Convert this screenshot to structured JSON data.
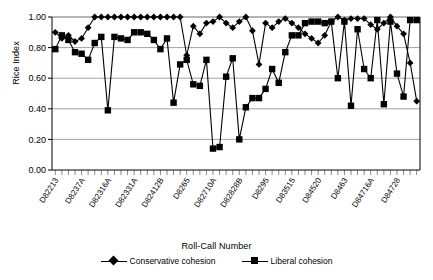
{
  "chart_data": {
    "type": "line",
    "title": "",
    "xlabel": "Roll-Call Number",
    "ylabel": "Rice Index",
    "ylim": [
      0.0,
      1.0
    ],
    "ytick_labels": [
      "0.00",
      "0.20",
      "0.40",
      "0.60",
      "0.80",
      "1.00"
    ],
    "ytick_values": [
      0.0,
      0.2,
      0.4,
      0.6,
      0.8,
      1.0
    ],
    "grid": "horizontal",
    "legend_position": "below",
    "xtick_labels": [
      "D82213",
      "D8237A",
      "D82316A",
      "D82331A",
      "D82412B",
      "D8265",
      "D82710A",
      "D82828B",
      "D8295",
      "D83515",
      "D84520",
      "D8463",
      "D84716A",
      "D84728"
    ],
    "xtick_indices": [
      0,
      4,
      8,
      12,
      16,
      20,
      24,
      28,
      32,
      36,
      40,
      44,
      48,
      52
    ],
    "n_points": 56,
    "series": [
      {
        "name": "Conservative cohesion",
        "marker": "diamond",
        "values": [
          0.9,
          0.86,
          0.88,
          0.84,
          0.86,
          0.93,
          1.0,
          1.0,
          1.0,
          1.0,
          1.0,
          1.0,
          1.0,
          1.0,
          1.0,
          1.0,
          1.0,
          1.0,
          1.0,
          1.0,
          0.75,
          0.94,
          0.89,
          0.96,
          0.97,
          1.0,
          0.96,
          0.93,
          0.97,
          1.0,
          0.91,
          0.69,
          0.96,
          0.93,
          0.97,
          0.99,
          0.96,
          0.93,
          0.89,
          0.86,
          0.83,
          0.88,
          0.97,
          1.0,
          0.98,
          0.99,
          0.99,
          0.99,
          0.95,
          0.92,
          0.96,
          1.0,
          0.94,
          0.89,
          0.7,
          0.45
        ]
      },
      {
        "name": "Liberal cohesion",
        "marker": "square",
        "values": [
          0.79,
          0.88,
          0.85,
          0.77,
          0.76,
          0.72,
          0.83,
          0.87,
          0.39,
          0.87,
          0.86,
          0.85,
          0.9,
          0.9,
          0.89,
          0.85,
          0.79,
          0.86,
          0.44,
          0.69,
          0.72,
          0.56,
          0.55,
          0.72,
          0.14,
          0.15,
          0.61,
          0.73,
          0.2,
          0.41,
          0.47,
          0.47,
          0.53,
          0.66,
          0.57,
          0.77,
          0.88,
          0.88,
          0.96,
          0.97,
          0.97,
          0.96,
          0.97,
          0.6,
          0.97,
          0.42,
          0.92,
          0.66,
          0.6,
          0.98,
          0.43,
          0.97,
          0.63,
          0.48,
          0.98,
          0.98
        ]
      }
    ]
  },
  "legend": {
    "entries": [
      {
        "label": "Conservative cohesion"
      },
      {
        "label": "Liberal cohesion"
      }
    ]
  }
}
